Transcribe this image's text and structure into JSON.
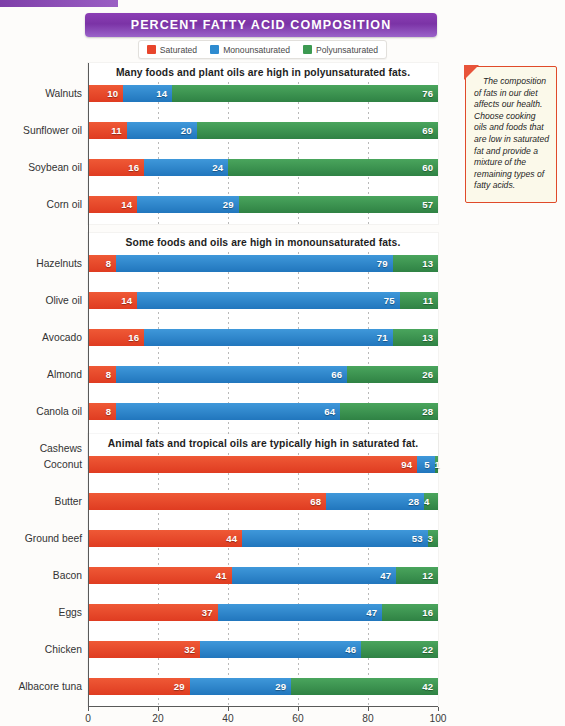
{
  "title": "PERCENT FATTY ACID COMPOSITION",
  "legend": [
    {
      "label": "Saturated",
      "color": "#e8452c",
      "key": "saturated"
    },
    {
      "label": "Monounsaturated",
      "color": "#2e8bd0",
      "key": "monounsaturated"
    },
    {
      "label": "Polyunsaturated",
      "color": "#3d9a52",
      "key": "polyunsaturated"
    }
  ],
  "callout": {
    "text": "The composition of fats in our diet affects our health. Choose cooking oils and foods that are low in saturated fat and provide a mixture of the remaining types of fatty acids."
  },
  "axis": {
    "xlabel": "% Fatty Acid Composition",
    "ticks": [
      "0",
      "20",
      "40",
      "60",
      "80",
      "100"
    ],
    "xlim": [
      0,
      100
    ]
  },
  "chart_data": {
    "type": "bar",
    "orientation": "horizontal",
    "stacked": true,
    "title": "PERCENT FATTY ACID COMPOSITION",
    "xlabel": "% Fatty Acid Composition",
    "ylabel": "",
    "xlim": [
      0,
      100
    ],
    "grid": true,
    "legend_position": "top",
    "series": [
      {
        "name": "Saturated",
        "color": "#e8452c"
      },
      {
        "name": "Monounsaturated",
        "color": "#2e8bd0"
      },
      {
        "name": "Polyunsaturated",
        "color": "#3d9a52"
      }
    ],
    "panels": [
      {
        "title": "Many foods and plant oils are high in polyunsaturated fats.",
        "categories": [
          "Walnuts",
          "Sunflower oil",
          "Soybean oil",
          "Corn oil"
        ],
        "values": [
          {
            "category": "Walnuts",
            "saturated": 10,
            "monounsaturated": 14,
            "polyunsaturated": 76
          },
          {
            "category": "Sunflower oil",
            "saturated": 11,
            "monounsaturated": 20,
            "polyunsaturated": 69
          },
          {
            "category": "Soybean oil",
            "saturated": 16,
            "monounsaturated": 24,
            "polyunsaturated": 60
          },
          {
            "category": "Corn oil",
            "saturated": 14,
            "monounsaturated": 29,
            "polyunsaturated": 57
          }
        ]
      },
      {
        "title": "Some foods and oils are high in monounsaturated fats.",
        "categories": [
          "Hazelnuts",
          "Olive oil",
          "Avocado",
          "Almond",
          "Canola oil",
          "Cashews"
        ],
        "values": [
          {
            "category": "Hazelnuts",
            "saturated": 8,
            "monounsaturated": 79,
            "polyunsaturated": 13
          },
          {
            "category": "Olive oil",
            "saturated": 14,
            "monounsaturated": 75,
            "polyunsaturated": 11
          },
          {
            "category": "Avocado",
            "saturated": 16,
            "monounsaturated": 71,
            "polyunsaturated": 13
          },
          {
            "category": "Almond",
            "saturated": 8,
            "monounsaturated": 66,
            "polyunsaturated": 26
          },
          {
            "category": "Canola oil",
            "saturated": 8,
            "monounsaturated": 64,
            "polyunsaturated": 28
          },
          {
            "category": "Cashews",
            "saturated": 21,
            "monounsaturated": 61,
            "polyunsaturated": 18
          }
        ]
      },
      {
        "title": "Animal fats and tropical oils are typically high in saturated fat.",
        "categories": [
          "Coconut",
          "Butter",
          "Ground beef",
          "Bacon",
          "Eggs",
          "Chicken",
          "Albacore tuna"
        ],
        "values": [
          {
            "category": "Coconut",
            "saturated": 94,
            "monounsaturated": 5,
            "polyunsaturated": 1
          },
          {
            "category": "Butter",
            "saturated": 68,
            "monounsaturated": 28,
            "polyunsaturated": 4
          },
          {
            "category": "Ground beef",
            "saturated": 44,
            "monounsaturated": 53,
            "polyunsaturated": 3
          },
          {
            "category": "Bacon",
            "saturated": 41,
            "monounsaturated": 47,
            "polyunsaturated": 12
          },
          {
            "category": "Eggs",
            "saturated": 37,
            "monounsaturated": 47,
            "polyunsaturated": 16
          },
          {
            "category": "Chicken",
            "saturated": 32,
            "monounsaturated": 46,
            "polyunsaturated": 22
          },
          {
            "category": "Albacore tuna",
            "saturated": 29,
            "monounsaturated": 29,
            "polyunsaturated": 42
          }
        ]
      }
    ]
  }
}
